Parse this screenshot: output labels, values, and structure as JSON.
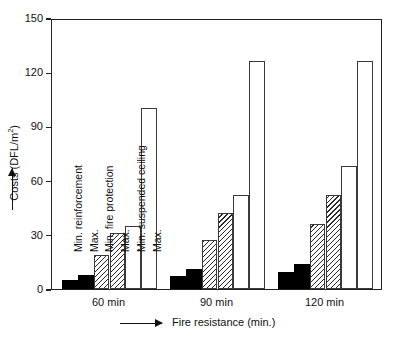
{
  "chart_data": {
    "type": "bar",
    "title": "",
    "subtitle": "",
    "xlabel": "Fire resistance (min.)",
    "ylabel": "Costs (DFL/m2)",
    "ylabel_display": "Costs (DFL/m²)",
    "categories": [
      "60 min",
      "90 min",
      "120 min"
    ],
    "ylim": [
      0,
      150
    ],
    "yticks": [
      0,
      30,
      60,
      90,
      120,
      150
    ],
    "ytick_labels": [
      "0",
      "30",
      "60",
      "90",
      "120",
      "150"
    ],
    "grid": false,
    "legend_position": "inline-rotated-labels",
    "series": [
      {
        "name": "Min. reinforcement",
        "style": "solid-black",
        "values": [
          5,
          7,
          9.5
        ]
      },
      {
        "name": "Max.",
        "style": "solid-black",
        "values": [
          7.5,
          11,
          14
        ]
      },
      {
        "name": "Min. fire protection",
        "style": "hatched",
        "values": [
          19,
          27,
          36
        ]
      },
      {
        "name": "Max.",
        "style": "hatched",
        "values": [
          31,
          42,
          52
        ]
      },
      {
        "name": "Min. suspended ceiling",
        "style": "white",
        "values": [
          35,
          52,
          68
        ]
      },
      {
        "name": "Max.",
        "style": "white",
        "values": [
          100,
          126,
          126
        ]
      }
    ],
    "series_captions": [
      "Min. reinforcement",
      "Max.",
      "Min. fire protection",
      "Max.",
      "Min. suspended ceiling",
      "Max."
    ],
    "colors": {
      "solid_black": "#000000",
      "hatch_line": "#2a2a2a",
      "white_fill": "#ffffff",
      "bar_outline": "#3a3a3a",
      "axis": "#222222",
      "text": "#111111",
      "background": "#ffffff"
    }
  },
  "axis": {
    "y_arrow": "up-arrow",
    "x_arrow": "right-arrow"
  }
}
